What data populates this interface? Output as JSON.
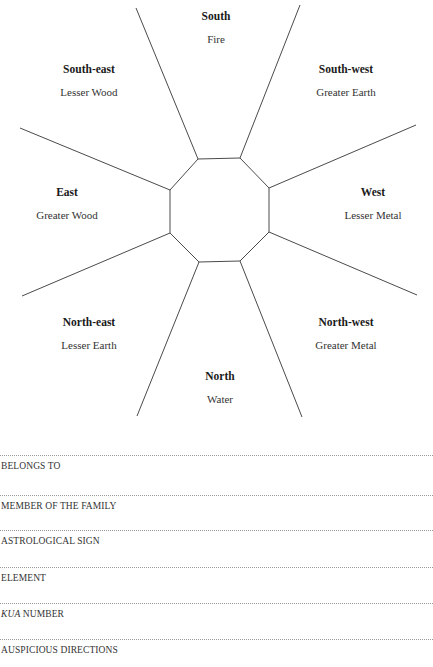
{
  "diagram": {
    "line_color": "#4a4a4a",
    "directions": [
      {
        "id": "south",
        "name": "South",
        "element": "Fire",
        "x": 216,
        "y": 10
      },
      {
        "id": "south-east",
        "name": "South-east",
        "element": "Lesser Wood",
        "x": 89,
        "y": 63
      },
      {
        "id": "south-west",
        "name": "South-west",
        "element": "Greater Earth",
        "x": 346,
        "y": 63
      },
      {
        "id": "east",
        "name": "East",
        "element": "Greater Wood",
        "x": 67,
        "y": 186
      },
      {
        "id": "west",
        "name": "West",
        "element": "Lesser Metal",
        "x": 373,
        "y": 186
      },
      {
        "id": "north-east",
        "name": "North-east",
        "element": "Lesser Earth",
        "x": 89,
        "y": 316
      },
      {
        "id": "north-west",
        "name": "North-west",
        "element": "Greater Metal",
        "x": 346,
        "y": 316
      },
      {
        "id": "north",
        "name": "North",
        "element": "Water",
        "x": 220,
        "y": 370
      }
    ],
    "octagon": [
      [
        198,
        159
      ],
      [
        240,
        158
      ],
      [
        269,
        188
      ],
      [
        269,
        232
      ],
      [
        240,
        261
      ],
      [
        199,
        262
      ],
      [
        170,
        233
      ],
      [
        170,
        190
      ]
    ],
    "spokes": [
      [
        [
          198,
          159
        ],
        [
          136,
          8
        ]
      ],
      [
        [
          240,
          158
        ],
        [
          300,
          5
        ]
      ],
      [
        [
          269,
          188
        ],
        [
          416,
          125
        ]
      ],
      [
        [
          269,
          232
        ],
        [
          417,
          295
        ]
      ],
      [
        [
          240,
          261
        ],
        [
          302,
          417
        ]
      ],
      [
        [
          199,
          262
        ],
        [
          137,
          416
        ]
      ],
      [
        [
          170,
          233
        ],
        [
          22,
          296
        ]
      ],
      [
        [
          170,
          190
        ],
        [
          20,
          128
        ]
      ]
    ]
  },
  "form": {
    "fields": [
      {
        "label": "BELONGS TO",
        "italic_prefix": "",
        "y": 455
      },
      {
        "label": "MEMBER OF THE FAMILY",
        "italic_prefix": "",
        "y": 495
      },
      {
        "label": "ASTROLOGICAL SIGN",
        "italic_prefix": "",
        "y": 530
      },
      {
        "label": "ELEMENT",
        "italic_prefix": "",
        "y": 567
      },
      {
        "label": " NUMBER",
        "italic_prefix": "KUA",
        "y": 603
      },
      {
        "label": "AUSPICIOUS DIRECTIONS",
        "italic_prefix": "",
        "y": 639
      }
    ]
  }
}
